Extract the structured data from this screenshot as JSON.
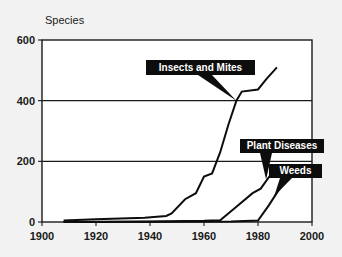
{
  "figure": {
    "background_color": "#f2f2f2",
    "plot_background_color": "#ffffff",
    "line_color": "#0d0d0d",
    "callout_background_color": "#0d0d0d",
    "callout_text_color": "#ffffff"
  },
  "chart_data": {
    "type": "line",
    "title": "",
    "subtitle": "",
    "xlabel": "",
    "ylabel": "Species",
    "ylabel_position": "top-left",
    "xlim": [
      1900,
      2000
    ],
    "ylim": [
      0,
      600
    ],
    "xticks": [
      1900,
      1920,
      1940,
      1960,
      1980,
      2000
    ],
    "xtick_labels": [
      "1900",
      "1920",
      "1940",
      "1960",
      "1980",
      "2000"
    ],
    "yticks": [
      0,
      200,
      400,
      600
    ],
    "ytick_labels": [
      "0",
      "200",
      "400",
      "600"
    ],
    "grid": "horizontal",
    "legend": "annotations",
    "series": [
      {
        "name": "Insects and Mites",
        "label": "Insects and Mites",
        "x": [
          1908,
          1920,
          1938,
          1946,
          1948,
          1953,
          1957,
          1960,
          1963,
          1966,
          1969,
          1972,
          1974,
          1980,
          1983,
          1987
        ],
        "y": [
          5,
          9,
          14,
          20,
          28,
          75,
          95,
          150,
          160,
          230,
          320,
          400,
          430,
          437,
          470,
          510
        ]
      },
      {
        "name": "Plant Diseases",
        "label": "Plant Diseases",
        "x": [
          1908,
          1940,
          1960,
          1966,
          1972,
          1978,
          1981,
          1985
        ],
        "y": [
          0,
          2,
          4,
          6,
          50,
          95,
          110,
          160
        ]
      },
      {
        "name": "Weeds",
        "label": "Weeds",
        "x": [
          1908,
          1950,
          1970,
          1980,
          1984,
          1988
        ],
        "y": [
          0,
          1,
          2,
          5,
          55,
          110
        ]
      }
    ],
    "annotations": [
      {
        "label": "Insects and Mites",
        "points_to_series": "Insects and Mites",
        "target_x": 1972,
        "target_y": 400
      },
      {
        "label": "Plant Diseases",
        "points_to_series": "Plant Diseases",
        "target_x": 1983,
        "target_y": 140
      },
      {
        "label": "Weeds",
        "points_to_series": "Weeds",
        "target_x": 1986,
        "target_y": 85
      }
    ]
  }
}
